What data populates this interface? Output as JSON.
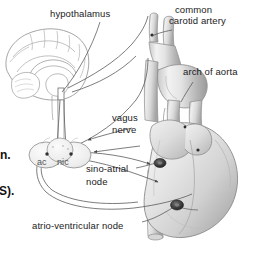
{
  "figure": {
    "background_color": "#ffffff",
    "line_color": "#4a4a4a",
    "text_color": "#1b1b1b",
    "width": 255,
    "height": 257
  },
  "labels": {
    "hypothalamus": "hypothalamus",
    "common_carotid_line1": "common",
    "common_carotid_line2": "carotid artery",
    "arch_of_aorta": "arch of aorta",
    "vagus_line1": "vagus",
    "vagus_line2": "nerve",
    "sino_atrial_line1": "sino-atrial",
    "sino_atrial_line2": "node",
    "atrio_ventricular": "atrio-ventricular node",
    "ganglion_left": "ac",
    "ganglion_right": "nic"
  },
  "cutoff_text": {
    "fragment_top": "n.",
    "fragment_bottom": "S)."
  },
  "structures": {
    "brain": "mid-sagittal brain section",
    "heart": "heart with great vessels",
    "sa_node_marker": "sino-atrial node marker",
    "av_node_marker": "atrio-ventricular node marker",
    "ganglia": "cardiac ganglia"
  }
}
